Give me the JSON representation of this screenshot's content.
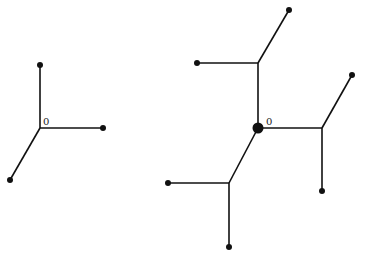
{
  "diagram": {
    "trees": [
      {
        "name": "tree-small",
        "root_label": "0",
        "root_marked": false,
        "nodes": {
          "root": [
            40,
            128
          ],
          "a": [
            40,
            65
          ],
          "b": [
            103,
            128
          ],
          "c": [
            10,
            180
          ]
        },
        "edges": [
          [
            "root",
            "a"
          ],
          [
            "root",
            "b"
          ],
          [
            "root",
            "c"
          ]
        ],
        "leaves": [
          "a",
          "b",
          "c"
        ]
      },
      {
        "name": "tree-large",
        "root_label": "0",
        "root_marked": true,
        "nodes": {
          "root": [
            258,
            128
          ],
          "u": [
            258,
            63
          ],
          "u1": [
            289,
            10
          ],
          "u2": [
            197,
            63
          ],
          "r": [
            322,
            128
          ],
          "r1": [
            352,
            75
          ],
          "r2": [
            322,
            191
          ],
          "d": [
            229,
            183
          ],
          "d1": [
            168,
            183
          ],
          "d2": [
            229,
            247
          ]
        },
        "edges": [
          [
            "root",
            "u"
          ],
          [
            "u",
            "u1"
          ],
          [
            "u",
            "u2"
          ],
          [
            "root",
            "r"
          ],
          [
            "r",
            "r1"
          ],
          [
            "r",
            "r2"
          ],
          [
            "root",
            "d"
          ],
          [
            "d",
            "d1"
          ],
          [
            "d",
            "d2"
          ]
        ],
        "leaves": [
          "u1",
          "u2",
          "r1",
          "r2",
          "d1",
          "d2"
        ]
      }
    ]
  }
}
